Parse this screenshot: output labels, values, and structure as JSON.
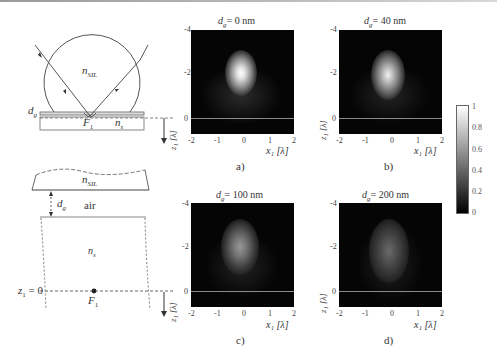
{
  "schematic_top": {
    "labels": {
      "n_sil": "n",
      "n_sil_sub": "SIL",
      "dg": "d",
      "dg_sub": "g",
      "focus": "F",
      "focus_sub": "1",
      "ns": "n",
      "ns_sub": "s"
    }
  },
  "schematic_bottom": {
    "labels": {
      "n_sil": "n",
      "n_sil_sub": "SIL",
      "dg": "d",
      "dg_sub": "g",
      "air": "air",
      "ns": "n",
      "ns_sub": "s",
      "z_origin": "z",
      "z_origin_sub": "1",
      "z_origin_eq": " = 0",
      "focus": "F",
      "focus_sub": "1"
    }
  },
  "axis_labels": {
    "z_axis": "z₁ [λ]",
    "x_axis": "x₁ [λ]"
  },
  "panels": [
    {
      "id": "a",
      "title_var": "d",
      "title_sub": "g",
      "title_val": "= 0 nm",
      "caption": "a)",
      "yticks": [
        "-4",
        "-2",
        "0"
      ],
      "xticks": [
        "-2",
        "-1",
        "0",
        "1",
        "2"
      ]
    },
    {
      "id": "b",
      "title_var": "d",
      "title_sub": "g",
      "title_val": "= 40 nm",
      "caption": "b)",
      "yticks": [
        "-4",
        "-2",
        "0"
      ],
      "xticks": [
        "-2",
        "-1",
        "0",
        "1",
        "2"
      ]
    },
    {
      "id": "c",
      "title_var": "d",
      "title_sub": "g",
      "title_val": "= 100 nm",
      "caption": "c)",
      "yticks": [
        "-4",
        "-2",
        "0"
      ],
      "xticks": [
        "-2",
        "-1",
        "0",
        "1",
        "2"
      ]
    },
    {
      "id": "d",
      "title_var": "d",
      "title_sub": "g",
      "title_val": "= 200 nm",
      "caption": "d)",
      "yticks": [
        "-4",
        "-2",
        "0"
      ],
      "xticks": [
        "-2",
        "-1",
        "0",
        "1",
        "2"
      ]
    }
  ],
  "colorbar": {
    "ticks": [
      "1",
      "0.8",
      "0.6",
      "0.4",
      "0.2",
      "0"
    ],
    "colormap": "gray"
  },
  "colors": {
    "panel_bg": "#050505",
    "zero_line": "#8a8a8a",
    "line": "#444444"
  }
}
